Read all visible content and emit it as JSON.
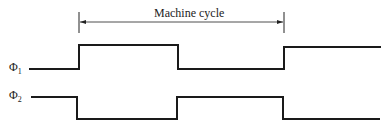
{
  "diagram": {
    "type": "timing-diagram",
    "cycle_label": "Machine cycle",
    "signals": [
      {
        "name": "Φ",
        "subscript": "1",
        "levels": [
          "low",
          "high",
          "low",
          "high"
        ],
        "transitions_x": [
          79,
          178,
          284
        ]
      },
      {
        "name": "Φ",
        "subscript": "2",
        "levels": [
          "high",
          "low",
          "high",
          "low"
        ],
        "transitions_x": [
          77,
          177,
          283
        ]
      }
    ],
    "cycle_span_x": [
      79,
      284
    ],
    "colors": {
      "line": "#1a1a1a",
      "background": "#ffffff"
    }
  }
}
